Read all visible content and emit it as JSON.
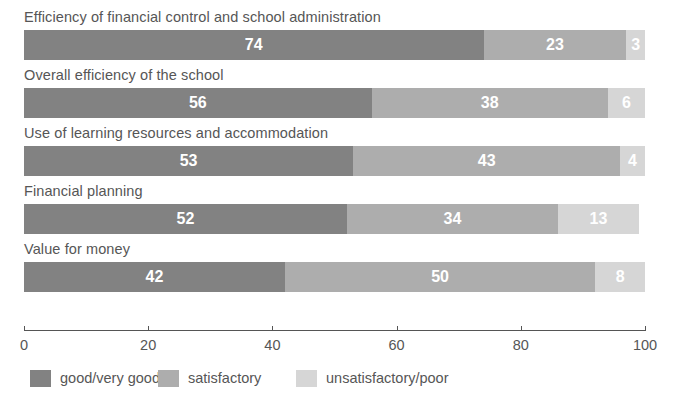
{
  "chart_data": {
    "type": "bar",
    "orientation": "horizontal",
    "stacked": true,
    "title": "",
    "xlabel": "",
    "ylabel": "",
    "xlim": [
      0,
      100
    ],
    "xticks": [
      0,
      20,
      40,
      60,
      80,
      100
    ],
    "xtick_labels": [
      "0",
      "20",
      "40",
      "60",
      "80",
      "100"
    ],
    "grid": false,
    "legend_position": "bottom",
    "categories": [
      "Efficiency of financial control and school administration",
      "Overall efficiency of the school",
      "Use of learning resources and accommodation",
      "Financial planning",
      "Value for money"
    ],
    "series": [
      {
        "name": "good/very good",
        "color": "#828282",
        "values": [
          74,
          56,
          53,
          52,
          42
        ]
      },
      {
        "name": "satisfactory",
        "color": "#adadad",
        "values": [
          23,
          38,
          43,
          34,
          50
        ]
      },
      {
        "name": "unsatisfactory/poor",
        "color": "#d6d6d6",
        "values": [
          3,
          6,
          4,
          13,
          8
        ]
      }
    ]
  },
  "rows": [
    {
      "label": "Efficiency of financial control and school administration",
      "segments": [
        {
          "key": "good",
          "value": "74"
        },
        {
          "key": "satis",
          "value": "23"
        },
        {
          "key": "unsatis",
          "value": "3"
        }
      ]
    },
    {
      "label": "Overall efficiency of the school",
      "segments": [
        {
          "key": "good",
          "value": "56"
        },
        {
          "key": "satis",
          "value": "38"
        },
        {
          "key": "unsatis",
          "value": "6"
        }
      ]
    },
    {
      "label": "Use of learning resources and accommodation",
      "segments": [
        {
          "key": "good",
          "value": "53"
        },
        {
          "key": "satis",
          "value": "43"
        },
        {
          "key": "unsatis",
          "value": "4"
        }
      ]
    },
    {
      "label": "Financial planning",
      "segments": [
        {
          "key": "good",
          "value": "52"
        },
        {
          "key": "satis",
          "value": "34"
        },
        {
          "key": "unsatis",
          "value": "13"
        }
      ]
    },
    {
      "label": "Value for money",
      "segments": [
        {
          "key": "good",
          "value": "42"
        },
        {
          "key": "satis",
          "value": "50"
        },
        {
          "key": "unsatis",
          "value": "8"
        }
      ]
    }
  ],
  "axis": {
    "ticks": [
      "0",
      "20",
      "40",
      "60",
      "80",
      "100"
    ]
  },
  "legend": [
    {
      "label": "good/very good",
      "key": "good",
      "color": "#828282"
    },
    {
      "label": "satisfactory",
      "key": "satis",
      "color": "#adadad"
    },
    {
      "label": "unsatisfactory/poor",
      "key": "unsatis",
      "color": "#d6d6d6"
    }
  ]
}
